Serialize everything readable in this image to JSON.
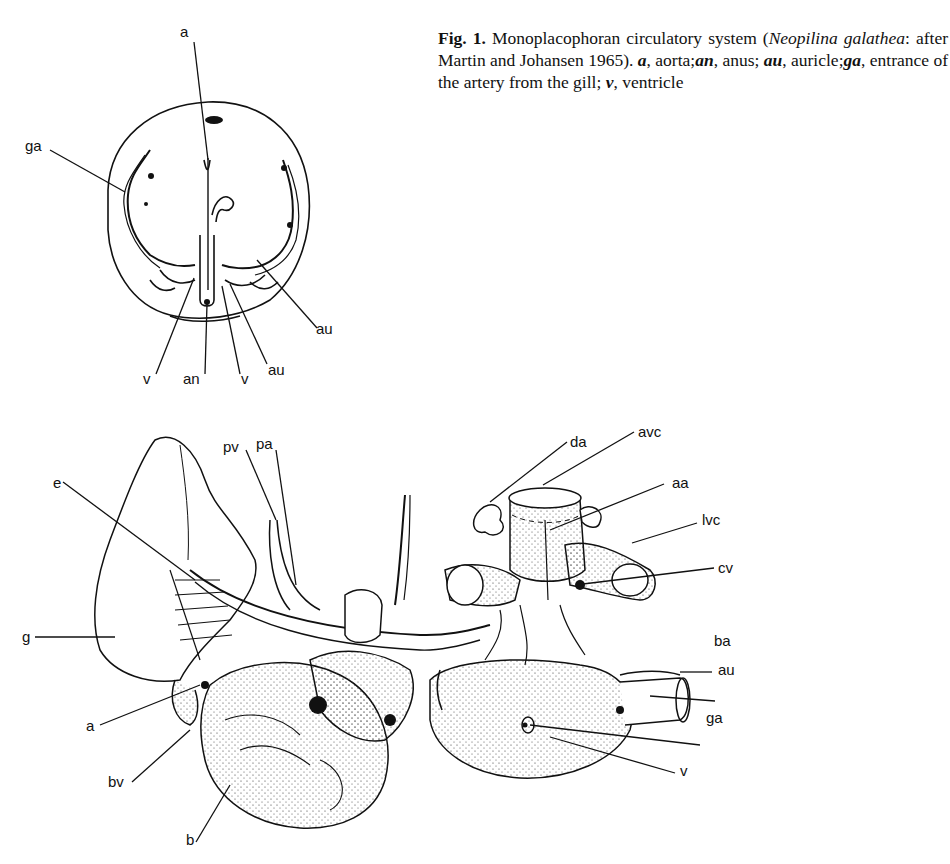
{
  "caption": {
    "fig_label": "Fig. 1.",
    "text_1": " Monoplacophoran circulatory system (",
    "species": "Neopilina galathea",
    "text_2": ": after Martin and Johansen 1965). ",
    "legend": [
      {
        "abbr": "a",
        "desc": "aorta"
      },
      {
        "abbr": "an",
        "desc": "anus"
      },
      {
        "abbr": "au",
        "desc": "auricle"
      },
      {
        "abbr": "ga",
        "desc": "entrance of the artery from the gill"
      },
      {
        "abbr": "v",
        "desc": "ventricle"
      }
    ]
  },
  "top_figure": {
    "labels": {
      "a": "a",
      "ga": "ga",
      "au_right": "au",
      "au_lower": "au",
      "v_left": "v",
      "an": "an",
      "v_right": "v"
    }
  },
  "bottom_figure": {
    "labels": {
      "pv": "pv",
      "pa": "pa",
      "e": "e",
      "g": "g",
      "a": "a",
      "bv": "bv",
      "b": "b",
      "da": "da",
      "avc": "avc",
      "aa": "aa",
      "lvc": "lvc",
      "cv": "cv",
      "ba": "ba",
      "au": "au",
      "ga": "ga",
      "v": "v"
    }
  }
}
